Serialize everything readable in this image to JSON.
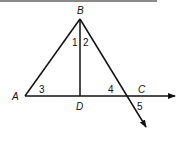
{
  "diagram": {
    "type": "geometry",
    "points": [
      {
        "id": "A",
        "label": "A",
        "x": 25,
        "y": 96,
        "lx": 15,
        "ly": 99
      },
      {
        "id": "B",
        "label": "B",
        "x": 80,
        "y": 19,
        "lx": 80,
        "ly": 14
      },
      {
        "id": "D",
        "label": "D",
        "x": 80,
        "y": 96,
        "lx": 80,
        "ly": 109
      },
      {
        "id": "C",
        "label": "C",
        "x": 127,
        "y": 96,
        "lx": 142,
        "ly": 93
      }
    ],
    "angles": [
      {
        "label": "1",
        "x": 75,
        "y": 45
      },
      {
        "label": "2",
        "x": 85,
        "y": 45
      },
      {
        "label": "3",
        "x": 42,
        "y": 92
      },
      {
        "label": "4",
        "x": 111,
        "y": 92
      },
      {
        "label": "5",
        "x": 140,
        "y": 110
      }
    ],
    "colors": {
      "stroke": "#111111",
      "topbar": "#8a8a8a"
    }
  },
  "labels": {
    "A": "A",
    "B": "B",
    "C": "C",
    "D": "D",
    "a1": "1",
    "a2": "2",
    "a3": "3",
    "a4": "4",
    "a5": "5"
  }
}
